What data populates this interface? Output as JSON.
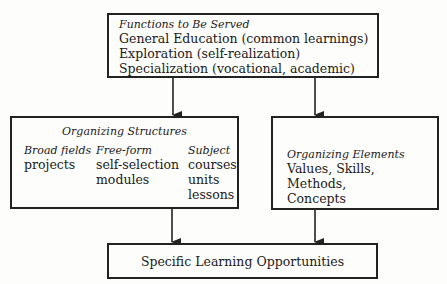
{
  "functions_box": {
    "title": "Functions to Be Served",
    "items": [
      "General Education (common learnings)",
      "Exploration (self-realization)",
      "Specialization (vocational, academic)"
    ]
  },
  "structures_box": {
    "title": "Organizing Structures",
    "columns": [
      {
        "heading": "Broad fields",
        "items": [
          "projects"
        ]
      },
      {
        "heading": "Free-form",
        "items": [
          "self-selection",
          "modules"
        ]
      },
      {
        "heading": "Subject",
        "items": [
          "courses",
          "units",
          "lessons"
        ]
      }
    ]
  },
  "elements_box": {
    "title": "Organizing Elements",
    "lines": [
      "Values, Skills, Methods,",
      "Concepts"
    ]
  },
  "outcome_box": {
    "label": "Specific Learning Opportunities"
  }
}
